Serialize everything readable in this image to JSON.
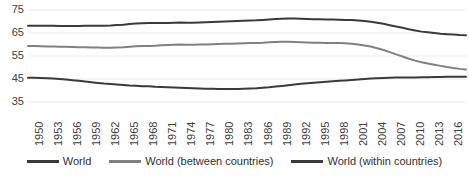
{
  "chart_data": {
    "type": "line",
    "title": "",
    "xlabel": "",
    "ylabel": "",
    "ylim": [
      35,
      75
    ],
    "yticks": [
      75,
      65,
      55,
      45,
      35
    ],
    "grid": true,
    "legend_position": "bottom",
    "xlim": [
      1950,
      2019
    ],
    "xticks": [
      "1950",
      "1953",
      "1956",
      "1959",
      "1962",
      "1965",
      "1968",
      "1971",
      "1974",
      "1977",
      "1980",
      "1983",
      "1986",
      "1989",
      "1992",
      "1995",
      "1998",
      "2001",
      "2004",
      "2007",
      "2010",
      "2013",
      "2016",
      "2019"
    ],
    "x": [
      1950,
      1951,
      1952,
      1953,
      1954,
      1955,
      1956,
      1957,
      1958,
      1959,
      1960,
      1961,
      1962,
      1963,
      1964,
      1965,
      1966,
      1967,
      1968,
      1969,
      1970,
      1971,
      1972,
      1973,
      1974,
      1975,
      1976,
      1977,
      1978,
      1979,
      1980,
      1981,
      1982,
      1983,
      1984,
      1985,
      1986,
      1987,
      1988,
      1989,
      1990,
      1991,
      1992,
      1993,
      1994,
      1995,
      1996,
      1997,
      1998,
      1999,
      2000,
      2001,
      2002,
      2003,
      2004,
      2005,
      2006,
      2007,
      2008,
      2009,
      2010,
      2011,
      2012,
      2013,
      2014,
      2015,
      2016,
      2017,
      2018,
      2019
    ],
    "series": [
      {
        "name": "World",
        "color": "#3a3a3a",
        "values": [
          68.2,
          68.2,
          68.1,
          68.1,
          68.1,
          68.0,
          68.0,
          68.0,
          68.0,
          68.1,
          68.2,
          68.2,
          68.2,
          68.3,
          68.5,
          68.6,
          68.9,
          69.1,
          69.2,
          69.3,
          69.3,
          69.4,
          69.4,
          69.5,
          69.6,
          69.5,
          69.5,
          69.6,
          69.7,
          69.8,
          69.9,
          70.0,
          70.1,
          70.2,
          70.3,
          70.4,
          70.5,
          70.7,
          70.9,
          71.1,
          71.2,
          71.3,
          71.3,
          71.2,
          71.1,
          71.0,
          71.0,
          70.9,
          70.9,
          70.8,
          70.7,
          70.6,
          70.4,
          70.2,
          69.9,
          69.5,
          69.0,
          68.4,
          67.8,
          67.3,
          66.6,
          66.1,
          65.6,
          65.3,
          65.0,
          64.7,
          64.5,
          64.3,
          64.1,
          64.0
        ]
      },
      {
        "name": "World (between countries)",
        "color": "#808080",
        "values": [
          59.3,
          59.3,
          59.2,
          59.1,
          59.1,
          59.0,
          59.0,
          58.9,
          58.8,
          58.8,
          58.7,
          58.7,
          58.6,
          58.6,
          58.7,
          58.8,
          59.0,
          59.2,
          59.3,
          59.4,
          59.5,
          59.7,
          59.8,
          59.9,
          60.0,
          59.9,
          59.9,
          60.0,
          60.0,
          60.1,
          60.2,
          60.3,
          60.3,
          60.4,
          60.5,
          60.6,
          60.7,
          60.8,
          61.0,
          61.1,
          61.2,
          61.2,
          61.1,
          61.0,
          60.9,
          60.8,
          60.8,
          60.7,
          60.7,
          60.6,
          60.5,
          60.3,
          60.0,
          59.6,
          59.1,
          58.4,
          57.6,
          56.7,
          55.7,
          54.8,
          53.8,
          53.0,
          52.3,
          51.7,
          51.2,
          50.7,
          50.2,
          49.8,
          49.4,
          49.1
        ]
      },
      {
        "name": "World (within countries)",
        "color": "#3a3a3a",
        "values": [
          45.5,
          45.5,
          45.4,
          45.3,
          45.2,
          45.0,
          44.8,
          44.5,
          44.2,
          43.9,
          43.6,
          43.3,
          43.0,
          42.8,
          42.6,
          42.4,
          42.2,
          42.1,
          41.9,
          41.8,
          41.6,
          41.5,
          41.4,
          41.3,
          41.2,
          41.1,
          41.0,
          40.9,
          40.8,
          40.8,
          40.7,
          40.7,
          40.7,
          40.7,
          40.8,
          40.9,
          41.0,
          41.2,
          41.4,
          41.7,
          42.0,
          42.3,
          42.6,
          42.9,
          43.2,
          43.4,
          43.6,
          43.8,
          44.0,
          44.2,
          44.4,
          44.6,
          44.8,
          45.0,
          45.2,
          45.3,
          45.4,
          45.5,
          45.6,
          45.6,
          45.7,
          45.7,
          45.8,
          45.8,
          45.9,
          45.9,
          46.0,
          46.0,
          46.0,
          46.0
        ]
      }
    ]
  }
}
